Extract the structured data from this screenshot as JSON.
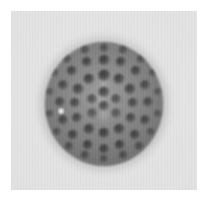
{
  "figure": {
    "kind": "grayscale-micrograph",
    "subject_label": "spherical specimen with pitted surface",
    "caption": "",
    "plate": {
      "background_color": "#e2e2e2",
      "page_margin_color": "#ffffff",
      "left": 11,
      "top": 11,
      "width": 186,
      "height": 179
    },
    "specimen": {
      "shape": "sphere",
      "center_x": 103,
      "center_y": 104,
      "width": 118,
      "height": 124,
      "rim_color": "#6e6e6e",
      "core_color": "#8f8f8f",
      "darkest_pit_color": "#1e1e1e",
      "highlight_color": "#ffffff"
    },
    "surface_features": {
      "description": "concentric rings of dark circular pits",
      "ring_counts": [
        1,
        6,
        12,
        16,
        18
      ],
      "total_pits": 53,
      "pale_centers": 3
    }
  },
  "pits": [
    {
      "cx": 59.0,
      "cy": 50.0,
      "r": 5.6,
      "d": 0.95
    },
    {
      "cx": 59.0,
      "cy": 64.0,
      "r": 5.2,
      "d": 0.85
    },
    {
      "cx": 47.0,
      "cy": 57.0,
      "r": 5.0,
      "d": 0.8
    },
    {
      "cx": 71.0,
      "cy": 57.0,
      "r": 5.0,
      "d": 0.8
    },
    {
      "cx": 47.0,
      "cy": 71.0,
      "r": 4.8,
      "d": 0.7
    },
    {
      "cx": 71.0,
      "cy": 71.0,
      "r": 4.8,
      "d": 0.7
    },
    {
      "cx": 59.0,
      "cy": 33.0,
      "r": 5.8,
      "d": 1.0
    },
    {
      "cx": 44.0,
      "cy": 37.0,
      "r": 5.6,
      "d": 0.95
    },
    {
      "cx": 74.0,
      "cy": 37.0,
      "r": 5.6,
      "d": 0.95
    },
    {
      "cx": 33.0,
      "cy": 47.0,
      "r": 5.4,
      "d": 0.9
    },
    {
      "cx": 85.0,
      "cy": 47.0,
      "r": 5.4,
      "d": 0.9
    },
    {
      "cx": 30.0,
      "cy": 61.0,
      "r": 5.2,
      "d": 0.85
    },
    {
      "cx": 88.0,
      "cy": 61.0,
      "r": 5.2,
      "d": 0.85
    },
    {
      "cx": 32.0,
      "cy": 76.0,
      "r": 5.2,
      "d": 0.85
    },
    {
      "cx": 86.0,
      "cy": 76.0,
      "r": 5.2,
      "d": 0.85
    },
    {
      "cx": 44.0,
      "cy": 87.0,
      "r": 5.4,
      "d": 0.9
    },
    {
      "cx": 74.0,
      "cy": 87.0,
      "r": 5.4,
      "d": 0.9
    },
    {
      "cx": 59.0,
      "cy": 91.0,
      "r": 5.6,
      "d": 0.95
    },
    {
      "cx": 59.0,
      "cy": 18.0,
      "r": 5.4,
      "d": 0.95
    },
    {
      "cx": 42.0,
      "cy": 20.0,
      "r": 5.2,
      "d": 0.9
    },
    {
      "cx": 76.0,
      "cy": 20.0,
      "r": 5.2,
      "d": 0.9
    },
    {
      "cx": 27.0,
      "cy": 29.0,
      "r": 5.2,
      "d": 0.88
    },
    {
      "cx": 91.0,
      "cy": 29.0,
      "r": 5.2,
      "d": 0.88
    },
    {
      "cx": 18.0,
      "cy": 43.0,
      "r": 5.0,
      "d": 0.82
    },
    {
      "cx": 100.0,
      "cy": 43.0,
      "r": 5.0,
      "d": 0.82
    },
    {
      "cx": 15.0,
      "cy": 60.0,
      "r": 5.0,
      "d": 0.8
    },
    {
      "cx": 103.0,
      "cy": 60.0,
      "r": 5.0,
      "d": 0.8
    },
    {
      "cx": 18.0,
      "cy": 78.0,
      "r": 5.0,
      "d": 0.82
    },
    {
      "cx": 100.0,
      "cy": 78.0,
      "r": 5.0,
      "d": 0.82
    },
    {
      "cx": 28.0,
      "cy": 93.0,
      "r": 5.2,
      "d": 0.88
    },
    {
      "cx": 90.0,
      "cy": 93.0,
      "r": 5.2,
      "d": 0.88
    },
    {
      "cx": 43.0,
      "cy": 103.0,
      "r": 5.2,
      "d": 0.9
    },
    {
      "cx": 75.0,
      "cy": 103.0,
      "r": 5.2,
      "d": 0.9
    },
    {
      "cx": 59.0,
      "cy": 107.0,
      "r": 5.0,
      "d": 0.88
    },
    {
      "cx": 59.0,
      "cy": 6.0,
      "r": 4.4,
      "d": 0.7
    },
    {
      "cx": 40.0,
      "cy": 8.0,
      "r": 4.4,
      "d": 0.68
    },
    {
      "cx": 78.0,
      "cy": 8.0,
      "r": 4.4,
      "d": 0.68
    },
    {
      "cx": 22.0,
      "cy": 17.0,
      "r": 4.4,
      "d": 0.66
    },
    {
      "cx": 96.0,
      "cy": 17.0,
      "r": 4.4,
      "d": 0.66
    },
    {
      "cx": 10.0,
      "cy": 31.0,
      "r": 4.2,
      "d": 0.62
    },
    {
      "cx": 108.0,
      "cy": 31.0,
      "r": 4.2,
      "d": 0.62
    },
    {
      "cx": 5.0,
      "cy": 50.0,
      "r": 4.2,
      "d": 0.58
    },
    {
      "cx": 113.0,
      "cy": 50.0,
      "r": 4.2,
      "d": 0.58
    },
    {
      "cx": 5.0,
      "cy": 72.0,
      "r": 4.2,
      "d": 0.58
    },
    {
      "cx": 113.0,
      "cy": 72.0,
      "r": 4.2,
      "d": 0.58
    },
    {
      "cx": 12.0,
      "cy": 90.0,
      "r": 4.2,
      "d": 0.62
    },
    {
      "cx": 106.0,
      "cy": 90.0,
      "r": 4.2,
      "d": 0.62
    },
    {
      "cx": 24.0,
      "cy": 104.0,
      "r": 4.4,
      "d": 0.66
    },
    {
      "cx": 94.0,
      "cy": 104.0,
      "r": 4.4,
      "d": 0.66
    },
    {
      "cx": 40.0,
      "cy": 113.0,
      "r": 4.4,
      "d": 0.68
    },
    {
      "cx": 78.0,
      "cy": 113.0,
      "r": 4.4,
      "d": 0.68
    },
    {
      "cx": 59.0,
      "cy": 117.0,
      "r": 4.2,
      "d": 0.64
    }
  ],
  "pale_centers": [
    {
      "cx": 59.0,
      "cy": 42.0,
      "r": 7.0
    },
    {
      "cx": 59.0,
      "cy": 73.0,
      "r": 7.5
    },
    {
      "cx": 56.0,
      "cy": 58.0,
      "r": 6.0
    }
  ],
  "highlight": {
    "cx": 16.0,
    "cy": 69.0,
    "r": 3.4
  }
}
